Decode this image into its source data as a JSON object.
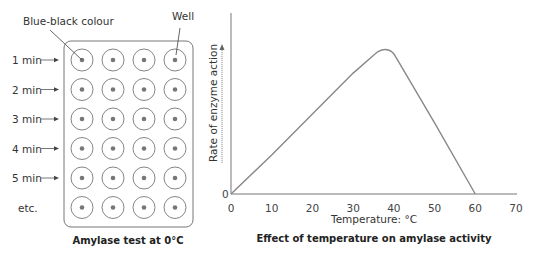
{
  "plate": {
    "caption": "Amylase test at 0°C",
    "labels": {
      "blue_black": "Blue-black colour",
      "well": "Well"
    },
    "rows": [
      "1 min",
      "2 min",
      "3 min",
      "4 min",
      "5 min",
      "etc."
    ],
    "columns": 4
  },
  "graph": {
    "caption": "Effect of temperature on amylase activity",
    "xlabel": "Temperature: °C",
    "ylabel": "Rate of enzyme action",
    "y_origin_label": "0",
    "x_ticks": [
      "0",
      "10",
      "20",
      "30",
      "40",
      "50",
      "60",
      "70"
    ]
  },
  "chart_data": {
    "type": "line",
    "title": "Effect of temperature on amylase activity",
    "xlabel": "Temperature: °C",
    "ylabel": "Rate of enzyme action",
    "xlim": [
      0,
      70
    ],
    "x_ticks": [
      0,
      10,
      20,
      30,
      40,
      50,
      60,
      70
    ],
    "series": [
      {
        "name": "Rate of enzyme action (relative)",
        "x": [
          0,
          10,
          20,
          30,
          36,
          38,
          40,
          50,
          60
        ],
        "y": [
          0,
          22,
          45,
          68,
          80,
          81,
          78,
          40,
          0
        ]
      }
    ],
    "grid": false,
    "legend": "none"
  }
}
